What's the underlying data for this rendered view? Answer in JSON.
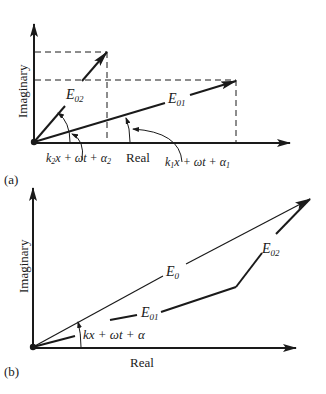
{
  "panel_a": {
    "label": "(a)",
    "y_axis_label": "Imaginary",
    "x_axis_label": "Real",
    "vectors": [
      {
        "name": "E",
        "sub": "02",
        "role": "second-wave-phasor"
      },
      {
        "name": "E",
        "sub": "01",
        "role": "first-wave-phasor"
      }
    ],
    "angle_labels": [
      {
        "k": "k",
        "ksub": "2",
        "rest": "x + ωt + α",
        "asub": "2"
      },
      {
        "k": "k",
        "ksub": "1",
        "rest": "x + ωt + α",
        "asub": "1"
      }
    ]
  },
  "panel_b": {
    "label": "(b)",
    "y_axis_label": "Imaginary",
    "x_axis_label": "Real",
    "vectors": [
      {
        "name": "E",
        "sub": "0",
        "role": "resultant-phasor"
      },
      {
        "name": "E",
        "sub": "01",
        "role": "first-wave-phasor"
      },
      {
        "name": "E",
        "sub": "02",
        "role": "second-wave-phasor"
      }
    ],
    "angle_label": "kx + ωt + α"
  },
  "colors": {
    "ink": "#1a1a1a",
    "background": "#ffffff"
  }
}
